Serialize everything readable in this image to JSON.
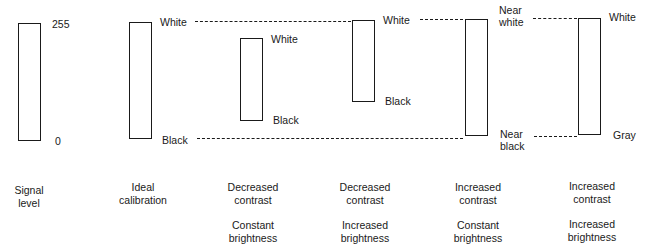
{
  "diagram": {
    "columns": [
      {
        "id": "signal-level",
        "bar": {
          "top": 23,
          "bottom": 141
        },
        "top_label": "255",
        "bottom_label": "0",
        "caption": [
          "Signal",
          "level"
        ],
        "caption2": []
      },
      {
        "id": "ideal-calibration",
        "bar": {
          "top": 22,
          "bottom": 139
        },
        "top_label": "White",
        "bottom_label": "Black",
        "caption": [
          "Ideal",
          "calibration"
        ],
        "caption2": []
      },
      {
        "id": "decreased-contrast-constant-brightness",
        "bar": {
          "top": 38,
          "bottom": 121
        },
        "top_label": "White",
        "bottom_label": "Black",
        "caption": [
          "Decreased",
          "contrast"
        ],
        "caption2": [
          "Constant",
          "brightness"
        ]
      },
      {
        "id": "decreased-contrast-increased-brightness",
        "bar": {
          "top": 20,
          "bottom": 102
        },
        "top_label": "White",
        "bottom_label": "Black",
        "caption": [
          "Decreased",
          "contrast"
        ],
        "caption2": [
          "Increased",
          "brightness"
        ]
      },
      {
        "id": "increased-contrast-constant-brightness",
        "bar": {
          "top": 19,
          "bottom": 136
        },
        "top_label": [
          "Near",
          "white"
        ],
        "bottom_label": [
          "Near",
          "black"
        ],
        "caption": [
          "Increased",
          "contrast"
        ],
        "caption2": [
          "Constant",
          "brightness"
        ]
      },
      {
        "id": "increased-contrast-increased-brightness",
        "bar": {
          "top": 18,
          "bottom": 135
        },
        "top_label": "White",
        "bottom_label": "Gray",
        "caption": [
          "Increased",
          "contrast"
        ],
        "caption2": [
          "Increased",
          "brightness"
        ]
      }
    ],
    "reference_lines": {
      "white_level": "dashed",
      "black_level": "dashed"
    }
  }
}
